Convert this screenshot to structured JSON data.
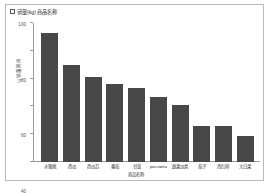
{
  "legend": {
    "checkbox_icon": "checkbox-unchecked-icon",
    "checked": false,
    "label": "销量(kg) 商品名称"
  },
  "colors": {
    "bar": "#484848",
    "axis": "#9a9a9a",
    "frame": "#b9b9b9",
    "background": "#ffffff",
    "text": "#2f2f2f"
  },
  "chart_data": {
    "type": "bar",
    "title": "",
    "xlabel": "商品名称",
    "ylabel": "以销量排序",
    "ylim": [
      0,
      100
    ],
    "yticks": [
      0,
      20,
      40,
      60,
      80,
      100
    ],
    "ytick_labels": [
      "0",
      "20",
      "40",
      "60",
      "80",
      "100"
    ],
    "grid": false,
    "legend_position": "top-left",
    "legend_entries": [
      "销量(kg) 商品名称"
    ],
    "categories": [
      "水蜜桃",
      "西瓜",
      "西瓜芯",
      "番茄",
      "甘蓝",
      "рослина",
      "蔬菜瓜类",
      "茄子",
      "西红柿",
      "大白菜"
    ],
    "values": [
      93,
      70,
      61,
      56,
      53,
      47,
      41,
      26,
      26,
      19
    ],
    "series": [
      {
        "name": "销量(kg)",
        "values": [
          93,
          70,
          61,
          56,
          53,
          47,
          41,
          26,
          26,
          19
        ]
      }
    ]
  }
}
